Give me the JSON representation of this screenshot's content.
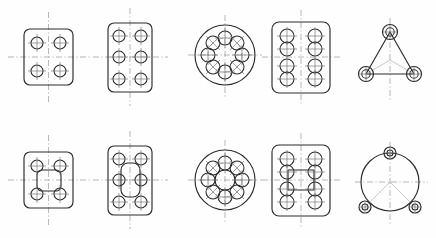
{
  "sheet": {
    "title": "Mounting Flange Plate Outlines",
    "width": 436,
    "height": 238,
    "background_color": "#fefefe",
    "line_color": "#2b2b2b",
    "centerline_color": "#9a9a9a",
    "construction_color": "#a5a5a5",
    "rows": 2,
    "columns": 5,
    "total_figures": 10
  },
  "figures": [
    {
      "id": "fig-1",
      "name": "square-plate-4-holes",
      "row": 1,
      "column": 1,
      "body_shape": "rounded-square",
      "center": [
        48.5,
        57
      ],
      "body": {
        "x": 24,
        "y": 29,
        "width": 49,
        "height": 56,
        "corner_radius": 6
      },
      "hole_count": 4,
      "hole_radius": 6,
      "hole_pattern": "rectangular-4-corner",
      "hole_centers": [
        [
          37,
          43
        ],
        [
          60,
          43
        ],
        [
          37,
          71
        ],
        [
          60,
          71
        ]
      ],
      "center_hole": null,
      "bolt_circle": false,
      "centerlines": [
        "horizontal",
        "vertical"
      ]
    },
    {
      "id": "fig-2",
      "name": "rect-plate-6-holes",
      "row": 1,
      "column": 2,
      "body_shape": "rounded-rectangle",
      "center": [
        130,
        57
      ],
      "body": {
        "x": 108,
        "y": 23,
        "width": 44,
        "height": 69,
        "corner_radius": 6
      },
      "hole_count": 6,
      "hole_radius": 6,
      "hole_pattern": "grid-2x3",
      "hole_centers": [
        [
          119,
          36
        ],
        [
          141,
          36
        ],
        [
          119,
          57
        ],
        [
          141,
          57
        ],
        [
          119,
          79
        ],
        [
          141,
          79
        ]
      ],
      "center_hole": null,
      "bolt_circle": false,
      "centerlines": [
        "horizontal",
        "vertical"
      ]
    },
    {
      "id": "fig-3",
      "name": "round-flange-8-holes",
      "row": 1,
      "column": 3,
      "body_shape": "circle",
      "center": [
        225,
        55
      ],
      "body": {
        "cx": 225,
        "cy": 55,
        "radius": 30
      },
      "hole_count": 8,
      "hole_radius": 7,
      "hole_pattern": "radial-8",
      "bolt_circle": true,
      "bolt_circle_radius": 17,
      "bolt_circle_start_angle": -90,
      "center_hole": null,
      "centerlines": [
        "horizontal",
        "vertical"
      ]
    },
    {
      "id": "fig-4",
      "name": "rect-plate-8-holes-paired",
      "row": 1,
      "column": 4,
      "body_shape": "rounded-rectangle",
      "center": [
        301,
        57
      ],
      "body": {
        "x": 272,
        "y": 22,
        "width": 58,
        "height": 71,
        "corner_radius": 7
      },
      "hole_count": 8,
      "hole_radius": 7,
      "hole_pattern": "paired-corners-vertical",
      "hole_centers": [
        [
          287,
          36
        ],
        [
          287,
          49
        ],
        [
          315,
          36
        ],
        [
          315,
          49
        ],
        [
          287,
          66
        ],
        [
          287,
          79
        ],
        [
          315,
          66
        ],
        [
          315,
          79
        ]
      ],
      "center_hole": null,
      "bolt_circle": false,
      "centerlines": [
        "horizontal",
        "vertical"
      ]
    },
    {
      "id": "fig-5",
      "name": "triangular-plate-3-holes",
      "row": 1,
      "column": 5,
      "body_shape": "triangle-rounded-vertices",
      "center": [
        390,
        60
      ],
      "vertices": [
        [
          390,
          32
        ],
        [
          366,
          74
        ],
        [
          414,
          74
        ]
      ],
      "hole_count": 3,
      "hole_radius": 5,
      "boss_radius": 7.5,
      "hole_pattern": "triangular-3",
      "center_hole": null,
      "bolt_circle": false,
      "construction_lines": true,
      "centerlines": [
        "vertical"
      ]
    },
    {
      "id": "fig-6",
      "name": "square-plate-4-holes-square-bore",
      "row": 2,
      "column": 1,
      "body_shape": "rounded-square",
      "center": [
        48.5,
        180
      ],
      "body": {
        "x": 24,
        "y": 152,
        "width": 49,
        "height": 56,
        "corner_radius": 6
      },
      "hole_count": 4,
      "hole_radius": 6,
      "hole_pattern": "rectangular-4-corner",
      "hole_centers": [
        [
          37,
          166
        ],
        [
          60,
          166
        ],
        [
          37,
          194
        ],
        [
          60,
          194
        ]
      ],
      "center_hole": {
        "shape": "rounded-square",
        "x": 37,
        "y": 170,
        "width": 24,
        "height": 21,
        "corner_radius": 5
      },
      "bolt_circle": false,
      "centerlines": [
        "horizontal",
        "vertical"
      ]
    },
    {
      "id": "fig-7",
      "name": "rect-plate-6-holes-slot-bore",
      "row": 2,
      "column": 2,
      "body_shape": "rounded-rectangle",
      "center": [
        130,
        180
      ],
      "body": {
        "x": 108,
        "y": 146,
        "width": 44,
        "height": 69,
        "corner_radius": 6
      },
      "hole_count": 6,
      "hole_radius": 6,
      "hole_pattern": "grid-2x3",
      "hole_centers": [
        [
          119,
          159
        ],
        [
          141,
          159
        ],
        [
          119,
          180
        ],
        [
          141,
          180
        ],
        [
          119,
          202
        ],
        [
          141,
          202
        ]
      ],
      "center_hole": {
        "shape": "rounded-rectangle",
        "x": 121,
        "y": 163,
        "width": 19,
        "height": 34,
        "corner_radius": 7
      },
      "bolt_circle": false,
      "centerlines": [
        "horizontal",
        "vertical"
      ]
    },
    {
      "id": "fig-8",
      "name": "round-flange-8-holes-center-bore",
      "row": 2,
      "column": 3,
      "body_shape": "circle",
      "center": [
        225,
        180
      ],
      "body": {
        "cx": 225,
        "cy": 180,
        "radius": 30
      },
      "hole_count": 8,
      "hole_radius": 7,
      "hole_pattern": "radial-8",
      "bolt_circle": true,
      "bolt_circle_radius": 17,
      "bolt_circle_start_angle": -90,
      "center_hole": {
        "shape": "circle",
        "radius": 10
      },
      "centerlines": [
        "horizontal",
        "vertical"
      ]
    },
    {
      "id": "fig-9",
      "name": "rect-plate-8-holes-square-bore",
      "row": 2,
      "column": 4,
      "body_shape": "rounded-rectangle",
      "center": [
        301,
        180
      ],
      "body": {
        "x": 272,
        "y": 145,
        "width": 58,
        "height": 71,
        "corner_radius": 7
      },
      "hole_count": 8,
      "hole_radius": 7,
      "hole_pattern": "paired-corners-vertical",
      "hole_centers": [
        [
          287,
          159
        ],
        [
          287,
          172
        ],
        [
          315,
          159
        ],
        [
          315,
          172
        ],
        [
          287,
          189
        ],
        [
          287,
          202
        ],
        [
          315,
          189
        ],
        [
          315,
          202
        ]
      ],
      "center_hole": {
        "shape": "square",
        "x": 288,
        "y": 170,
        "width": 26,
        "height": 20,
        "corner_radius": 0
      },
      "bolt_circle": false,
      "centerlines": [
        "horizontal",
        "vertical"
      ]
    },
    {
      "id": "fig-10",
      "name": "round-plate-3-lugs",
      "row": 2,
      "column": 5,
      "body_shape": "circle-with-lugs",
      "center": [
        390,
        182
      ],
      "body": {
        "cx": 390,
        "cy": 182,
        "radius": 29
      },
      "lug_count": 3,
      "lug_radius": 6,
      "lug_hole_radius": 3,
      "lug_angles_deg": [
        -90,
        150,
        30
      ],
      "hole_count": 3,
      "center_hole": null,
      "bolt_circle": false,
      "construction_lines": true,
      "centerlines": [
        "horizontal",
        "vertical"
      ]
    }
  ]
}
